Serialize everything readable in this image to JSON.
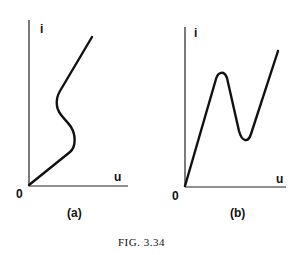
{
  "figure": {
    "caption": "FIG. 3.34",
    "panels": [
      {
        "id": "a",
        "label": "(a)",
        "y_axis": "i",
        "x_axis": "u",
        "origin": "0"
      },
      {
        "id": "b",
        "label": "(b)",
        "y_axis": "i",
        "x_axis": "u",
        "origin": "0"
      }
    ]
  },
  "colors": {
    "ink": "#111111",
    "background": "#ffffff"
  }
}
